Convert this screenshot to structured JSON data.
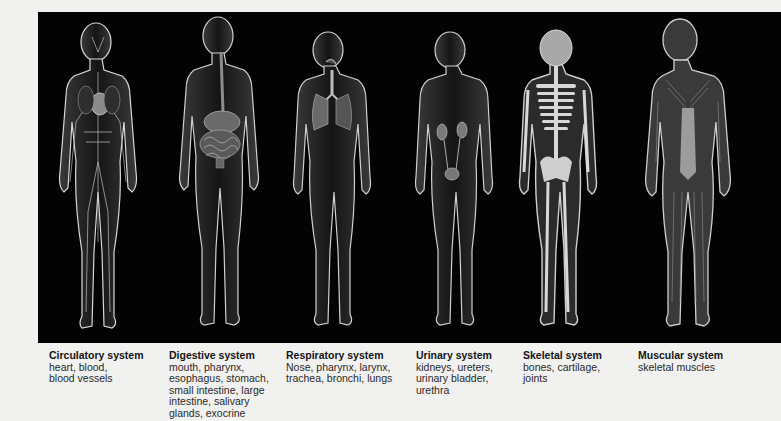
{
  "figure": {
    "background_color": "#030303",
    "page_color": "#f1f1ef",
    "systems": [
      {
        "id": "circulatory",
        "title": "Circulatory system",
        "description": "heart, blood,\nblood  vessels",
        "icon": "circulatory-figure-icon"
      },
      {
        "id": "digestive",
        "title": "Digestive system",
        "description": "mouth, pharynx,\nesophagus, stomach,\nsmall intestine, large\nintestine, salivary\nglands, exocrine",
        "icon": "digestive-figure-icon"
      },
      {
        "id": "respiratory",
        "title": "Respiratory system",
        "description": "Nose, pharynx, larynx,\ntrachea, bronchi, lungs",
        "icon": "respiratory-figure-icon"
      },
      {
        "id": "urinary",
        "title": "Urinary system",
        "description": "kidneys, ureters,\nurinary bladder,\nurethra",
        "icon": "urinary-figure-icon"
      },
      {
        "id": "skeletal",
        "title": "Skeletal system",
        "description": "bones, cartilage,\njoints",
        "icon": "skeletal-figure-icon"
      },
      {
        "id": "muscular",
        "title": "Muscular system",
        "description": "skeletal muscles",
        "icon": "muscular-figure-icon"
      }
    ]
  }
}
